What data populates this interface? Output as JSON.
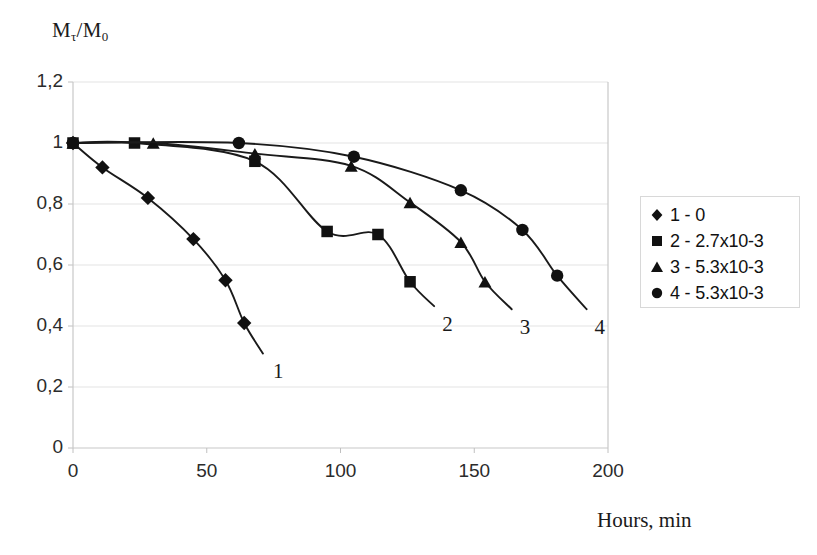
{
  "chart_data": {
    "type": "line",
    "title": "",
    "ylabel": "Mτ/M0",
    "ylabel_main": "M",
    "ylabel_sub1": "τ",
    "ylabel_mid": "/M",
    "ylabel_sub2": "0",
    "xlabel": "Hours, min",
    "xlim": [
      0,
      200
    ],
    "ylim": [
      0,
      1.2
    ],
    "grid": true,
    "xticks": [
      0,
      50,
      100,
      150,
      200
    ],
    "xtick_labels": [
      "0",
      "50",
      "100",
      "150",
      "200"
    ],
    "yticks": [
      0,
      0.2,
      0.4,
      0.6,
      0.8,
      1,
      1.2
    ],
    "ytick_labels": [
      "0",
      "0,2",
      "0,4",
      "0,6",
      "0,8",
      "1",
      "1,2"
    ],
    "legend_position": "right",
    "marker_color": "#111111",
    "line_color": "#1a1a1a",
    "grid_color": "#e3e3e3",
    "series": [
      {
        "name": "1 - 0",
        "curve_label": "1",
        "marker": "diamond",
        "x": [
          0,
          11,
          28,
          45,
          57,
          64
        ],
        "y": [
          1.0,
          0.92,
          0.82,
          0.685,
          0.55,
          0.41
        ],
        "tail_x": [
          64,
          71
        ],
        "tail_y": [
          0.41,
          0.31
        ]
      },
      {
        "name": "2 - 2.7x10-3",
        "curve_label": "2",
        "marker": "square",
        "x": [
          0,
          23,
          68,
          95,
          114,
          126
        ],
        "y": [
          1.0,
          1.0,
          0.94,
          0.71,
          0.7,
          0.545
        ],
        "tail_x": [
          126,
          135
        ],
        "tail_y": [
          0.545,
          0.465
        ]
      },
      {
        "name": "3 - 5.3x10-3",
        "curve_label": "3",
        "marker": "triangle",
        "x": [
          0,
          30,
          68,
          104,
          126,
          145,
          154
        ],
        "y": [
          1.0,
          1.0,
          0.965,
          0.925,
          0.805,
          0.675,
          0.545
        ],
        "tail_x": [
          154,
          164
        ],
        "tail_y": [
          0.545,
          0.455
        ]
      },
      {
        "name": "4 - 5.3x10-3",
        "curve_label": "4",
        "marker": "circle",
        "x": [
          0,
          62,
          105,
          145,
          168,
          181
        ],
        "y": [
          1.0,
          1.0,
          0.955,
          0.845,
          0.715,
          0.565
        ],
        "tail_x": [
          181,
          192
        ],
        "tail_y": [
          0.565,
          0.455
        ]
      }
    ]
  },
  "legend": {
    "items": [
      {
        "marker": "diamond",
        "label": "1 - 0"
      },
      {
        "marker": "square",
        "label": "2 - 2.7x10-3"
      },
      {
        "marker": "triangle",
        "label": "3 - 5.3x10-3"
      },
      {
        "marker": "circle",
        "label": "4 - 5.3x10-3"
      }
    ]
  }
}
